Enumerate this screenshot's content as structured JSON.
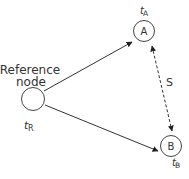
{
  "diagram": {
    "nodes": {
      "reference": {
        "label_line1": "Reference",
        "label_line2": "node",
        "time_var": "t",
        "time_sub": "R"
      },
      "a": {
        "label": "A",
        "time_var": "t",
        "time_sub": "A"
      },
      "b": {
        "label": "B",
        "time_var": "t",
        "time_sub": "B"
      }
    },
    "edges": {
      "distance_label": "S"
    },
    "colors": {
      "stroke": "#333333",
      "text": "#333333",
      "background": "#ffffff"
    }
  }
}
